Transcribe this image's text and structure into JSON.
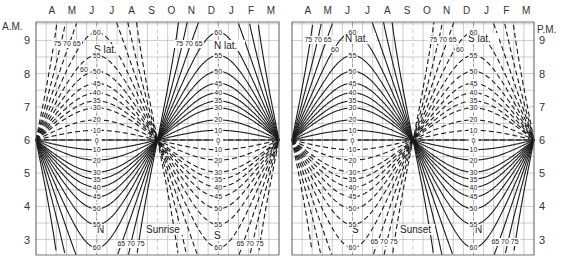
{
  "chart_data": [
    {
      "type": "line",
      "title": "Sunrise",
      "ylabel": "A.M.",
      "y_ticks": [
        9,
        8,
        7,
        6,
        5,
        4,
        3
      ],
      "ylim": [
        2.5,
        9.5
      ],
      "x_tick_labels": [
        "A",
        "M",
        "J",
        "J",
        "A",
        "S",
        "O",
        "N",
        "D",
        "J",
        "F",
        "M"
      ],
      "grid": true,
      "series_groups": [
        {
          "name": "N lat.",
          "style": "solid",
          "latitudes": [
            0,
            10,
            20,
            30,
            35,
            40,
            45,
            50,
            55,
            60,
            65,
            70,
            75
          ]
        },
        {
          "name": "S lat.",
          "style": "dashed",
          "latitudes": [
            0,
            10,
            20,
            30,
            35,
            40,
            45,
            50,
            55,
            60,
            65,
            70,
            75
          ]
        }
      ],
      "annotations": [
        "S lat.",
        "N lat.",
        "N",
        "S",
        "Sunrise",
        "75 70 65",
        "60",
        "55",
        "65 70 75"
      ]
    },
    {
      "type": "line",
      "title": "Sunset",
      "ylabel": "P.M.",
      "y_ticks": [
        9,
        8,
        7,
        6,
        5,
        4,
        3
      ],
      "ylim": [
        2.5,
        9.5
      ],
      "x_tick_labels": [
        "A",
        "M",
        "J",
        "J",
        "A",
        "S",
        "O",
        "N",
        "D",
        "J",
        "F",
        "M"
      ],
      "grid": true,
      "series_groups": [
        {
          "name": "N lat.",
          "style": "solid",
          "latitudes": [
            0,
            10,
            20,
            30,
            35,
            40,
            45,
            50,
            55,
            60,
            65,
            70,
            75
          ]
        },
        {
          "name": "S lat.",
          "style": "dashed",
          "latitudes": [
            0,
            10,
            20,
            30,
            35,
            40,
            45,
            50,
            55,
            60,
            65,
            70,
            75
          ]
        }
      ],
      "annotations": [
        "N lat.",
        "S lat.",
        "S",
        "N",
        "Sunset",
        "75 70 65",
        "60",
        "65 70 75"
      ]
    }
  ],
  "left": {
    "ylabel": "A.M.",
    "title": "Sunrise",
    "months": [
      "A",
      "M",
      "J",
      "J",
      "A",
      "S",
      "O",
      "N",
      "D",
      "J",
      "F",
      "M"
    ],
    "hours": [
      "9",
      "8",
      "7",
      "6",
      "5",
      "4",
      "3"
    ],
    "s_lat": "S  lat.",
    "n_lat": "N  lat.",
    "n_mark": "N",
    "s_mark": "S",
    "top_high_lats_left": "75 70 65",
    "top_high_lats_right": "75 70 65",
    "bottom_high_lats_left": "65 70 75",
    "bottom_high_lats_right": "65 70 75",
    "lat_labels": [
      "60",
      "55",
      "50",
      "45",
      "40",
      "35",
      "30",
      "20",
      "10",
      "0",
      "10",
      "20",
      "30",
      "35",
      "40",
      "45",
      "50",
      "55",
      "60"
    ]
  },
  "right": {
    "ylabel": "P.M.",
    "title": "Sunset",
    "months": [
      "A",
      "M",
      "J",
      "J",
      "A",
      "S",
      "O",
      "N",
      "D",
      "J",
      "F",
      "M"
    ],
    "hours": [
      "9",
      "8",
      "7",
      "6",
      "5",
      "4",
      "3"
    ],
    "n_lat": "N  lat.",
    "s_lat": "S  lat.",
    "s_mark": "S",
    "n_mark": "N",
    "top_high_lats_left": "75 70 65",
    "top_high_lats_right": "75 70 65",
    "bottom_high_lats_left": "65 70 75",
    "bottom_high_lats_right": "65 70 75",
    "lat_labels": [
      "55",
      "50",
      "45",
      "40",
      "35",
      "30",
      "20",
      "10",
      "0",
      "10",
      "20",
      "30",
      "35",
      "40",
      "45",
      "50",
      "55",
      "60"
    ]
  },
  "colors": {
    "curve": "#1a1a1a",
    "grid": "#9a9a9a",
    "frame": "#555555",
    "text": "#333333"
  }
}
